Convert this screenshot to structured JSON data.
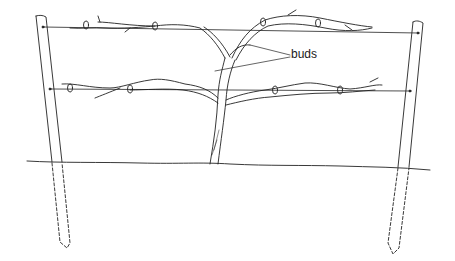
{
  "diagram": {
    "title": "",
    "labels": {
      "buds": "buds"
    },
    "colors": {
      "line": "#222222",
      "background": "#ffffff"
    },
    "elements": {
      "left_post": "wooden post",
      "right_post": "wooden post",
      "top_wire": "upper trellis wire",
      "bottom_wire": "lower trellis wire",
      "trunk": "vine trunk",
      "ground": "ground line"
    }
  }
}
